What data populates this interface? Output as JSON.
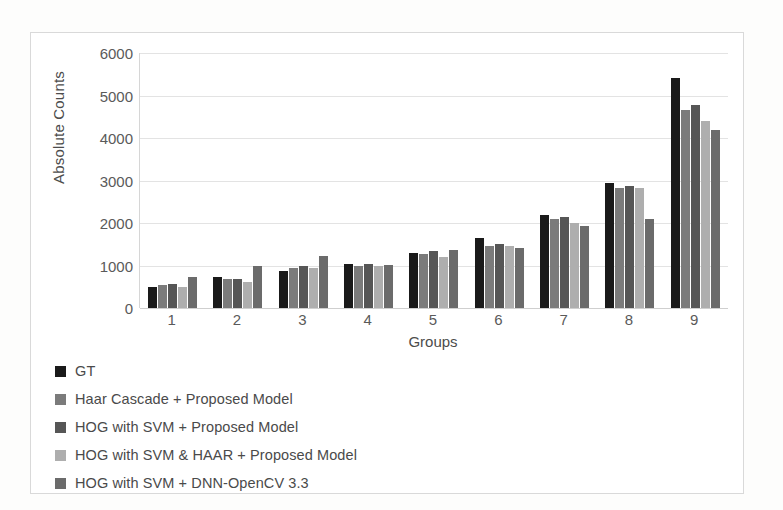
{
  "chart_data": {
    "type": "bar",
    "title": "",
    "xlabel": "Groups",
    "ylabel": "Absolute Counts",
    "categories": [
      "1",
      "2",
      "3",
      "4",
      "5",
      "6",
      "7",
      "8",
      "9"
    ],
    "ylim": [
      0,
      6000
    ],
    "yticks": [
      6000,
      5000,
      4000,
      3000,
      2000,
      1000,
      0
    ],
    "ytick_labels": [
      "6000",
      "5000",
      "4000",
      "3000",
      "2000",
      "1000",
      "0"
    ],
    "grid": true,
    "legend_position": "below-plot-left",
    "series": [
      {
        "name": "GT",
        "color": "#1a1a1a",
        "values": [
          500,
          720,
          880,
          1030,
          1300,
          1650,
          2200,
          2940,
          5420
        ]
      },
      {
        "name": "Haar Cascade + Proposed Model",
        "color": "#7b7b7b",
        "values": [
          540,
          680,
          950,
          1000,
          1270,
          1470,
          2090,
          2830,
          4650
        ]
      },
      {
        "name": "HOG with SVM + Proposed Model",
        "color": "#565656",
        "values": [
          560,
          680,
          1000,
          1030,
          1330,
          1500,
          2140,
          2870,
          4780
        ]
      },
      {
        "name": "HOG with SVM & HAAR + Proposed Model",
        "color": "#aeaeae",
        "values": [
          500,
          620,
          930,
          1000,
          1210,
          1470,
          1990,
          2820,
          4400
        ]
      },
      {
        "name": "HOG with SVM + DNN-OpenCV 3.3",
        "color": "#6b6b6b",
        "values": [
          720,
          1000,
          1220,
          1010,
          1370,
          1420,
          1930,
          2090,
          4180
        ]
      }
    ]
  }
}
